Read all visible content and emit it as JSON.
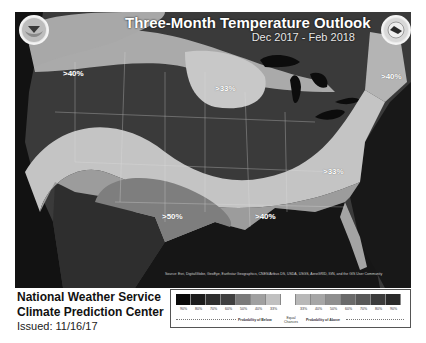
{
  "header": {
    "title": "Three-Month Temperature Outlook",
    "period": "Dec 2017 - Feb 2018",
    "logos": [
      "noaa-logo",
      "nws-logo"
    ]
  },
  "map": {
    "labels": [
      {
        "text": ">40%",
        "region": "northwest"
      },
      {
        "text": ">33%",
        "region": "north-central"
      },
      {
        "text": ">40%",
        "region": "new-england"
      },
      {
        "text": ">33%",
        "region": "mid-atlantic-south"
      },
      {
        "text": ">50%",
        "region": "southwest-texas"
      },
      {
        "text": ">40%",
        "region": "gulf-coast"
      }
    ],
    "attribution": "Source: Esri, DigitalGlobe, GeoEye, Earthstar Geographics, CNES/Airbus DS, USDA, USGS, AeroGRID, IGN, and the GIS User Community"
  },
  "footer": {
    "org_line1": "National Weather Service",
    "org_line2": "Climate Prediction Center",
    "issued": "Issued: 11/16/17"
  },
  "legend": {
    "swatch_colors": [
      "#0a0a0a",
      "#1c1c1c",
      "#2e2e2e",
      "#404040",
      "#7a7a7a",
      "#a0a0a0",
      "#c0c0c0",
      "#ffffff",
      "#b8b8b8",
      "#a6a6a6",
      "#8e8e8e",
      "#6a6a6a",
      "#585858",
      "#3c3c3c",
      "#2a2a2a"
    ],
    "ticks": [
      "90%",
      "80%",
      "70%",
      "60%",
      "50%",
      "40%",
      "33%",
      "",
      "33%",
      "40%",
      "50%",
      "60%",
      "70%",
      "80%",
      "90%"
    ],
    "below_label": "Probability of Below",
    "equal_label": "Equal Chances",
    "above_label": "Probability of Above"
  }
}
